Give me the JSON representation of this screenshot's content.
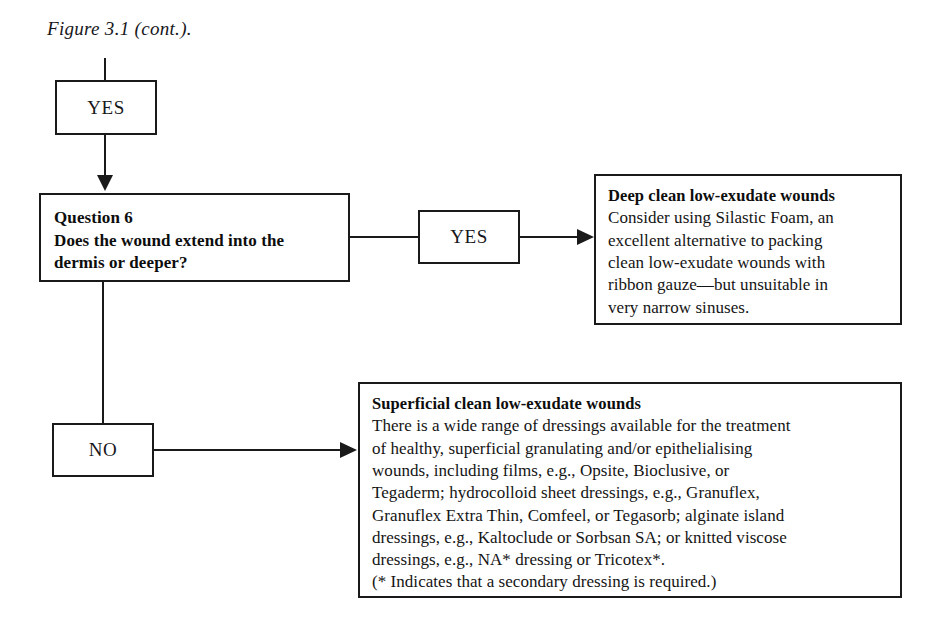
{
  "figure": {
    "caption": "Figure 3.1 (cont.)."
  },
  "nodes": {
    "yes_top": {
      "label": "YES"
    },
    "question6": {
      "lines": [
        "Question 6",
        "Does the wound extend into the",
        "dermis or deeper?"
      ]
    },
    "yes_middle": {
      "label": "YES"
    },
    "no_branch": {
      "label": "NO"
    },
    "deep_wounds": {
      "heading": "Deep clean low-exudate wounds",
      "lines": [
        "Consider using Silastic Foam, an",
        "excellent alternative to packing",
        "clean low-exudate wounds with",
        "ribbon gauze—but unsuitable in",
        "very narrow sinuses."
      ]
    },
    "superficial_wounds": {
      "heading": "Superficial clean low-exudate wounds",
      "lines": [
        "There is a wide range of dressings available for the treatment",
        "of healthy, superficial granulating and/or epithelialising",
        "wounds, including films, e.g., Opsite, Bioclusive, or",
        "Tegaderm; hydrocolloid sheet dressings, e.g., Granuflex,",
        "Granuflex Extra Thin, Comfeel, or Tegasorb; alginate island",
        "dressings, e.g., Kaltoclude or Sorbsan SA; or knitted viscose",
        "dressings, e.g., NA* dressing or Tricotex*.",
        "(* Indicates that a secondary dressing is required.)"
      ]
    }
  },
  "colors": {
    "ink": "#1a1a1a",
    "paper": "#ffffff"
  }
}
